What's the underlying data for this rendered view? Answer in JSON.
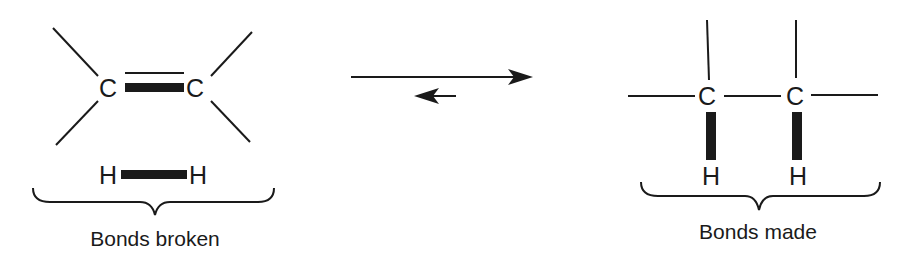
{
  "diagram": {
    "reactants": {
      "atoms": {
        "c1": "C",
        "c2": "C",
        "h1": "H",
        "h2": "H"
      },
      "label": "Bonds broken",
      "bonds_highlighted": [
        "C=C pi bond",
        "H-H bond"
      ]
    },
    "equilibrium": {
      "forward_arrow": "long forward arrow",
      "reverse_arrow": "short reverse arrow"
    },
    "products": {
      "atoms": {
        "c1": "C",
        "c2": "C",
        "h1": "H",
        "h2": "H"
      },
      "label": "Bonds made",
      "bonds_highlighted": [
        "C-H bond",
        "C-H bond"
      ]
    },
    "colors": {
      "ink": "#1a1a1a",
      "background": "#ffffff"
    }
  }
}
